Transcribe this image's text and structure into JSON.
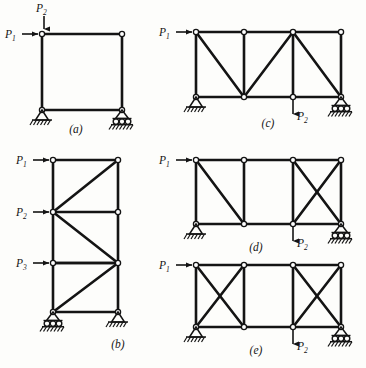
{
  "figure": {
    "background_color": "#fdfdfb",
    "ink_color": "#141414",
    "node_fill": "#ffffff"
  },
  "labels": {
    "p1": "P",
    "p1_sub": "1",
    "p2": "P",
    "p2_sub": "2",
    "p3": "P",
    "p3_sub": "3"
  },
  "captions": {
    "a": "(a)",
    "b": "(b)",
    "c": "(c)",
    "d": "(d)",
    "e": "(e)"
  },
  "panels": [
    {
      "id": "a",
      "caption": "(a)",
      "type": "portal-frame",
      "bays": 1,
      "stories": 1,
      "bracing": [
        "none"
      ],
      "supports": {
        "left": "pin",
        "right": "roller"
      },
      "loads": [
        {
          "name": "P1",
          "direction": "right",
          "applied_at": "top-left-node"
        },
        {
          "name": "P2",
          "direction": "down",
          "applied_at": "top-left-node"
        }
      ]
    },
    {
      "id": "b",
      "caption": "(b)",
      "type": "multi-story-braced-frame",
      "bays": 1,
      "stories": 4,
      "bracing": [
        "diagonal-up",
        "diagonal-down",
        "diagonal-up",
        "diagonal-up"
      ],
      "supports": {
        "left": "roller",
        "right": "pin"
      },
      "loads": [
        {
          "name": "P1",
          "direction": "right",
          "applied_at": "level-1-left-node"
        },
        {
          "name": "P2",
          "direction": "right",
          "applied_at": "level-2-left-node"
        },
        {
          "name": "P3",
          "direction": "right",
          "applied_at": "level-3-left-node"
        }
      ]
    },
    {
      "id": "c",
      "caption": "(c)",
      "type": "braced-truss",
      "bays": 3,
      "stories": 1,
      "bracing": [
        "diagonal-down",
        "diagonal-up",
        "diagonal-down"
      ],
      "supports": {
        "left": "pin",
        "right": "roller"
      },
      "loads": [
        {
          "name": "P1",
          "direction": "right",
          "applied_at": "top-left-node"
        },
        {
          "name": "P2",
          "direction": "down",
          "applied_at": "bottom-node-3"
        }
      ]
    },
    {
      "id": "d",
      "caption": "(d)",
      "type": "braced-truss",
      "bays": 3,
      "stories": 1,
      "bracing": [
        "diagonal-down",
        "none",
        "cross-brace"
      ],
      "supports": {
        "left": "pin",
        "right": "roller"
      },
      "loads": [
        {
          "name": "P1",
          "direction": "right",
          "applied_at": "top-left-node"
        },
        {
          "name": "P2",
          "direction": "down",
          "applied_at": "bottom-node-3"
        }
      ]
    },
    {
      "id": "e",
      "caption": "(e)",
      "type": "braced-truss",
      "bays": 3,
      "stories": 1,
      "bracing": [
        "cross-brace",
        "none",
        "cross-brace"
      ],
      "supports": {
        "left": "pin",
        "right": "roller"
      },
      "loads": [
        {
          "name": "P1",
          "direction": "right",
          "applied_at": "top-left-node"
        },
        {
          "name": "P2",
          "direction": "down",
          "applied_at": "bottom-node-3"
        }
      ]
    }
  ]
}
